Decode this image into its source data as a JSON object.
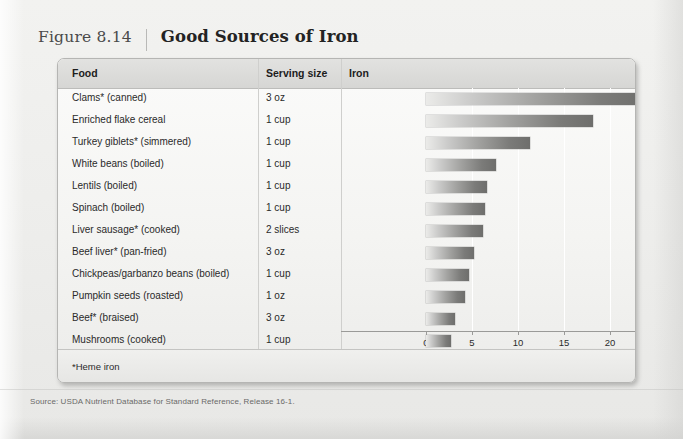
{
  "figure": {
    "number": "Figure 8.14",
    "title": "Good Sources of Iron"
  },
  "table": {
    "headers": {
      "food": "Food",
      "serving": "Serving size",
      "iron": "Iron"
    },
    "footnote": "*Heme iron"
  },
  "callout": {
    "title": "RDA",
    "women": "Women: 18 mg/day",
    "men": "Men: 8 mg/day"
  },
  "source": "Source: USDA Nutrient Database for Standard Reference, Release 16-1.",
  "chart_data": {
    "type": "bar",
    "orientation": "horizontal",
    "title": "Good Sources of Iron",
    "xlabel": "Milligrams (mg)",
    "ylabel": "Food",
    "xlim": [
      0,
      26.5
    ],
    "ticks": [
      0,
      5,
      10,
      15,
      20,
      25
    ],
    "tick_labels": [
      "0",
      "5",
      "10",
      "15",
      "20",
      "25"
    ],
    "grid": true,
    "legend": false,
    "categories": [
      "Clams* (canned)",
      "Enriched flake cereal",
      "Turkey giblets* (simmered)",
      "White beans (boiled)",
      "Lentils (boiled)",
      "Spinach (boiled)",
      "Liver sausage* (cooked)",
      "Beef liver* (pan-fried)",
      "Chickpeas/garbanzo beans (boiled)",
      "Pumpkin seeds (roasted)",
      "Beef* (braised)",
      "Mushrooms (cooked)"
    ],
    "serving_sizes": [
      "3 oz",
      "1 cup",
      "1 cup",
      "1 cup",
      "1 cup",
      "1 cup",
      "2 slices",
      "3 oz",
      "1 cup",
      "1 oz",
      "3 oz",
      "1 cup"
    ],
    "values": [
      23.8,
      18.2,
      11.3,
      7.6,
      6.6,
      6.4,
      6.2,
      5.2,
      4.7,
      4.2,
      3.2,
      2.7
    ],
    "units": "mg",
    "annotations": [
      "RDA",
      "Women: 18 mg/day",
      "Men: 8 mg/day"
    ],
    "footnote": "*Heme iron"
  }
}
